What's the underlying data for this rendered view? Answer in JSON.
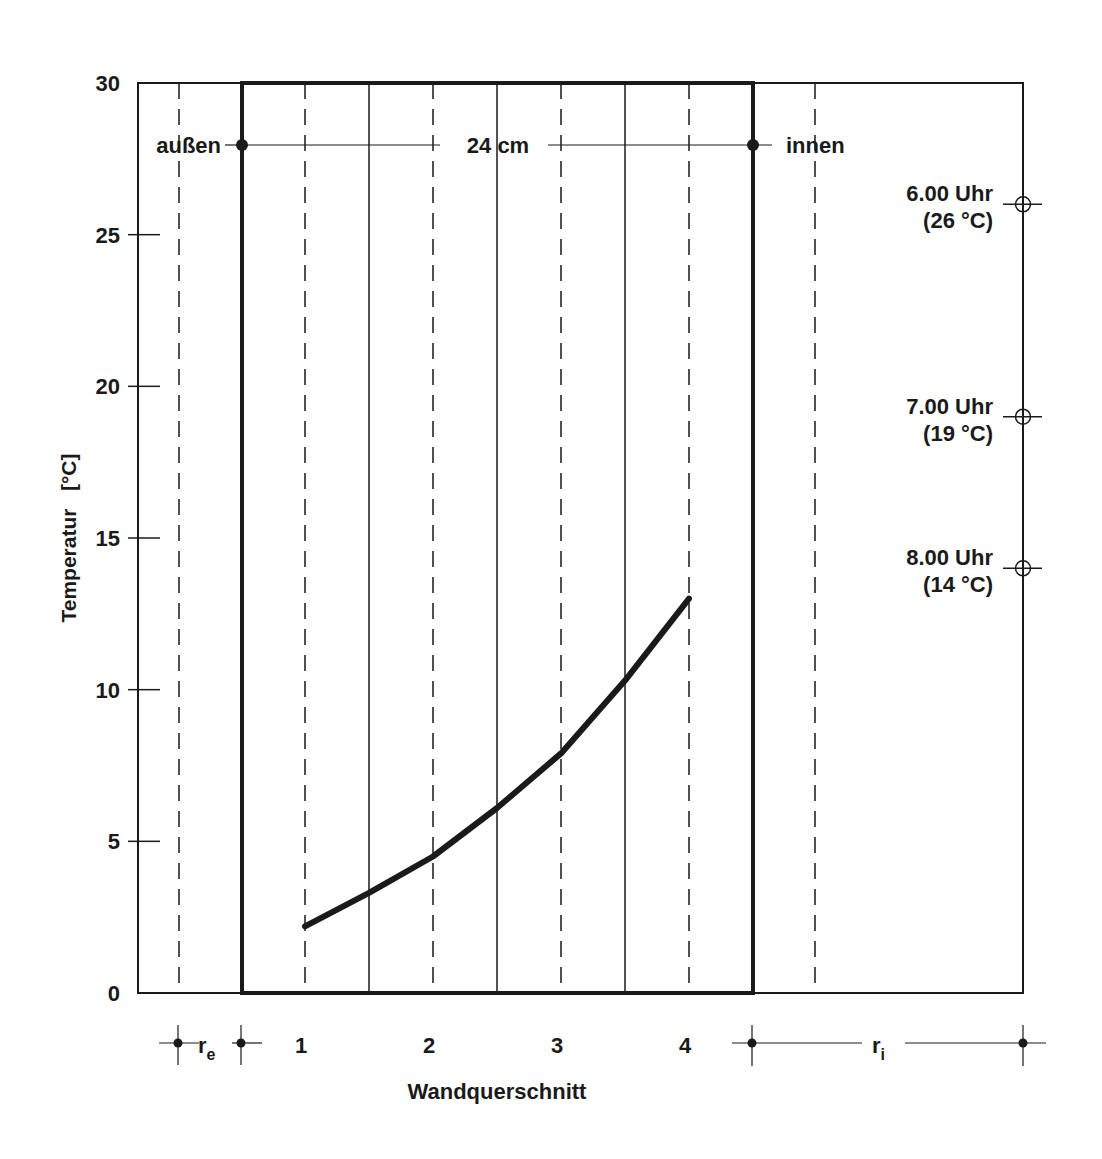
{
  "chart_data": {
    "type": "line",
    "title": "",
    "xlabel": "Wandquerschnitt",
    "ylabel": "Temperatur   [°C]",
    "ylim": [
      0,
      30
    ],
    "yticks": [
      0,
      5,
      10,
      15,
      20,
      25,
      30
    ],
    "ytick_labels": [
      "0",
      "5",
      "10",
      "15",
      "20",
      "25",
      "30"
    ],
    "categories": [
      "1",
      "2",
      "3",
      "4"
    ],
    "series": [
      {
        "name": "Temperaturverlauf Wand",
        "values": [
          2.2,
          4.5,
          7.9,
          13.0
        ]
      }
    ],
    "intermediate_points": [
      {
        "x": 1.5,
        "value": 3.3
      },
      {
        "x": 2.5,
        "value": 6.1
      },
      {
        "x": 3.5,
        "value": 10.3
      }
    ],
    "grid": true,
    "annotations": {
      "outside_label": "außen",
      "inside_label": "innen",
      "wall_thickness": "24 cm",
      "r_e_label": "r",
      "r_e_sub": "e",
      "r_i_label": "r",
      "r_i_sub": "i",
      "time_markers": [
        {
          "time": "6.00 Uhr",
          "temp_label": "(26 °C)",
          "value": 26
        },
        {
          "time": "7.00 Uhr",
          "temp_label": "(19 °C)",
          "value": 19
        },
        {
          "time": "8.00 Uhr",
          "temp_label": "(14 °C)",
          "value": 14
        }
      ]
    },
    "colors": {
      "line": "#1a1a1a",
      "frame": "#1a1a1a",
      "background": "#ffffff"
    }
  }
}
